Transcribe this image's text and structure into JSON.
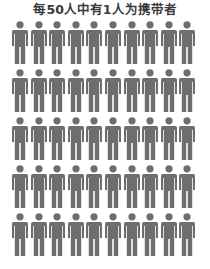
{
  "title": "每50人中有1人为携带者",
  "colors": {
    "figure": "#6e6e6e",
    "title": "#3a3a3a",
    "background": "#ffffff"
  },
  "grid": {
    "rows": 5,
    "columns": 10,
    "total": 50,
    "icon": "person-icon"
  }
}
